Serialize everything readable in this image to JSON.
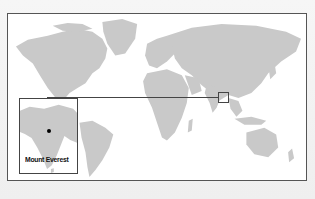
{
  "map": {
    "type": "world-locator-map",
    "land_color": "#c9c9c9",
    "ocean_color": "#ffffff",
    "frame_color": "#555555"
  },
  "inset": {
    "region": "Indian subcontinent",
    "label": "Mount Everest",
    "marker": "location-dot"
  },
  "highlight": {
    "region": "Himalayas"
  }
}
